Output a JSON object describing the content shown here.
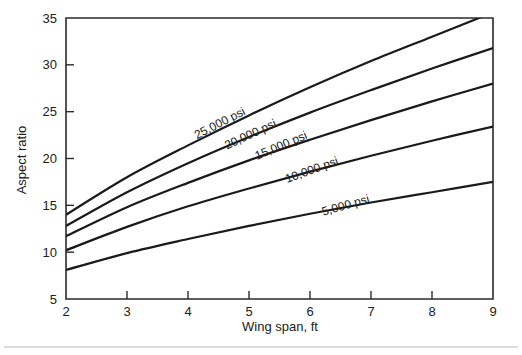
{
  "chart_data": {
    "type": "line",
    "title": "",
    "subtitle": "",
    "xlabel": "Wing span, ft",
    "ylabel": "Aspect ratio",
    "xlim": [
      2,
      9
    ],
    "ylim": [
      5,
      35
    ],
    "xticks": [
      "2",
      "3",
      "4",
      "5",
      "6",
      "7",
      "8",
      "9"
    ],
    "yticks": [
      "5",
      "10",
      "15",
      "20",
      "25",
      "30",
      "35"
    ],
    "grid": false,
    "legend_position": "inline-curve-labels",
    "x": [
      2,
      3,
      4,
      5,
      6,
      7,
      8,
      9
    ],
    "series": [
      {
        "name": "25,000 psi",
        "label": "25,000 psi",
        "values": [
          14.0,
          18.0,
          21.4,
          24.6,
          27.6,
          30.4,
          33.0,
          35.6
        ],
        "label_x": 4.55,
        "label_y": 23.4,
        "label_angle": -27
      },
      {
        "name": "20,000 psi",
        "label": "20,000 psi",
        "values": [
          12.8,
          16.4,
          19.5,
          22.3,
          24.9,
          27.3,
          29.6,
          31.8
        ],
        "label_x": 5.05,
        "label_y": 22.2,
        "label_angle": -25
      },
      {
        "name": "15,000 psi",
        "label": "15,000 psi",
        "values": [
          11.7,
          14.8,
          17.4,
          19.8,
          22.0,
          24.1,
          26.1,
          28.0
        ],
        "label_x": 5.55,
        "label_y": 21.0,
        "label_angle": -23
      },
      {
        "name": "10,000 psi",
        "label": "10,000 psi",
        "values": [
          10.2,
          12.7,
          14.9,
          16.8,
          18.6,
          20.3,
          21.9,
          23.4
        ],
        "label_x": 6.05,
        "label_y": 18.4,
        "label_angle": -20
      },
      {
        "name": "5,000 psi",
        "label": "5,000 psi",
        "values": [
          8.1,
          9.9,
          11.4,
          12.8,
          14.1,
          15.3,
          16.4,
          17.5
        ],
        "label_x": 6.6,
        "label_y": 14.6,
        "label_angle": -16
      }
    ],
    "colors": {
      "curve": "#1a1a1a",
      "axis": "#2b2b2b",
      "background": "#ffffff",
      "footer_rule": "#b9b9b9"
    }
  }
}
